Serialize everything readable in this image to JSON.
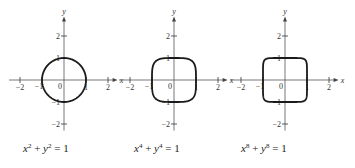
{
  "figure": {
    "plots": [
      {
        "exponent": 2,
        "equation": {
          "x_var": "x",
          "y_var": "y",
          "power": "2",
          "plus": " + ",
          "rhs": " = 1"
        },
        "x_axis_label": "x",
        "y_axis_label": "y",
        "x_ticks": [
          "−2",
          "−1",
          "0",
          "1",
          "2"
        ],
        "y_ticks": [
          "2",
          "1",
          "−1",
          "−2"
        ],
        "origin_label": "0"
      },
      {
        "exponent": 4,
        "equation": {
          "x_var": "x",
          "y_var": "y",
          "power": "4",
          "plus": " + ",
          "rhs": " = 1"
        },
        "x_axis_label": "x",
        "y_axis_label": "y",
        "x_ticks": [
          "−2",
          "−1",
          "0",
          "1",
          "2"
        ],
        "y_ticks": [
          "2",
          "1",
          "−1",
          "−2"
        ],
        "origin_label": "0"
      },
      {
        "exponent": 8,
        "equation": {
          "x_var": "x",
          "y_var": "y",
          "power": "8",
          "plus": " + ",
          "rhs": " = 1"
        },
        "x_axis_label": "x",
        "y_axis_label": "y",
        "x_ticks": [
          "−2",
          "−1",
          "0",
          "1",
          "2"
        ],
        "y_ticks": [
          "2",
          "1",
          "−1",
          "−2"
        ],
        "origin_label": "0"
      }
    ],
    "left_edge_x_label": "x"
  }
}
